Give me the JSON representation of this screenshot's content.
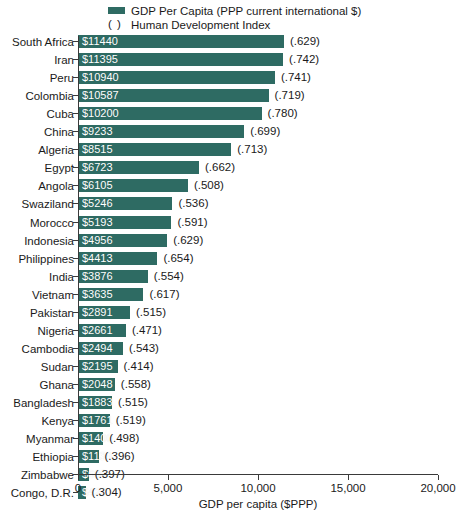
{
  "legend": {
    "series_label": "GDP Per Capita (PPP current international $)",
    "hdi_label": "Human Development Index",
    "hdi_marker": "( )",
    "series_color": "#2e6b63"
  },
  "axis": {
    "x_title": "GDP per capita ($PPP)",
    "ticks": [
      "0",
      "5,000",
      "10,000",
      "15,000",
      "20,000"
    ]
  },
  "chart_data": {
    "type": "bar",
    "orientation": "horizontal",
    "title": "",
    "xlabel": "GDP per capita ($PPP)",
    "ylabel": "",
    "xlim": [
      0,
      20000
    ],
    "xticks": [
      0,
      5000,
      10000,
      15000,
      20000
    ],
    "xtick_labels": [
      "0",
      "5,000",
      "10,000",
      "15,000",
      "20,000"
    ],
    "grid": false,
    "legend_position": "top",
    "legend_entries": [
      "GDP Per Capita (PPP current international $)",
      "( ) Human Development Index"
    ],
    "categories": [
      "South Africa",
      "Iran",
      "Peru",
      "Colombia",
      "Cuba",
      "China",
      "Algeria",
      "Egypt",
      "Angola",
      "Swaziland",
      "Morocco",
      "Indonesia",
      "Philippines",
      "India",
      "Vietnam",
      "Pakistan",
      "Nigeria",
      "Cambodia",
      "Sudan",
      "Ghana",
      "Bangladesh",
      "Kenya",
      "Myanmar",
      "Ethiopia",
      "Zimbabwe",
      "Congo, D.R."
    ],
    "values": [
      11440,
      11395,
      10940,
      10587,
      10200,
      9233,
      8515,
      6723,
      6105,
      5246,
      5193,
      4956,
      4413,
      3876,
      3635,
      2891,
      2661,
      2494,
      2195,
      2048,
      1883,
      1761,
      1400,
      1139,
      600,
      422
    ],
    "value_labels": [
      "$11440",
      "$11395",
      "$10940",
      "$10587",
      "$10200",
      "$9233",
      "$8515",
      "$6723",
      "$6105",
      "$5246",
      "$5193",
      "$4956",
      "$4413",
      "$3876",
      "$3635",
      "$2891",
      "$2661",
      "$2494",
      "$2195",
      "$2048",
      "$1883",
      "$1761",
      "$1400",
      "$1139",
      "$600",
      "$422"
    ],
    "annotations": {
      "name": "Human Development Index",
      "values": [
        0.629,
        0.742,
        0.741,
        0.719,
        0.78,
        0.699,
        0.713,
        0.662,
        0.508,
        0.536,
        0.591,
        0.629,
        0.654,
        0.554,
        0.617,
        0.515,
        0.471,
        0.543,
        0.414,
        0.558,
        0.515,
        0.519,
        0.498,
        0.396,
        0.397,
        0.304
      ],
      "labels": [
        "(.629)",
        "(.742)",
        "(.741)",
        "(.719)",
        "(.780)",
        "(.699)",
        "(.713)",
        "(.662)",
        "(.508)",
        "(.536)",
        "(.591)",
        "(.629)",
        "(.654)",
        "(.554)",
        "(.617)",
        "(.515)",
        "(.471)",
        "(.543)",
        "(.414)",
        "(.558)",
        "(.515)",
        "(.519)",
        "(.498)",
        "(.396)",
        "(.397)",
        "(.304)"
      ]
    }
  }
}
